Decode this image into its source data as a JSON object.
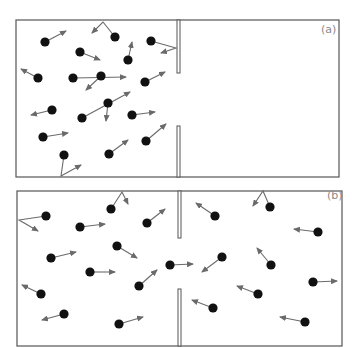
{
  "colors": {
    "frame": "#555555",
    "molecule": "#111111",
    "arrow": "#6a6a6a",
    "divider_fill": "#ffffff",
    "label": "#8a8a8a"
  },
  "panels": [
    {
      "id": "a",
      "label": "(a)",
      "label_pos": [
        321,
        33
      ],
      "box": {
        "x": 16,
        "y": 20,
        "w": 323,
        "h": 157
      },
      "divider": {
        "x": 177,
        "w": 3,
        "upper": [
          20,
          73
        ],
        "lower": [
          126,
          177
        ]
      },
      "molecules": [
        {
          "x": 45,
          "y": 42,
          "path": [
            [
              66,
              31
            ]
          ]
        },
        {
          "x": 115,
          "y": 37,
          "path": [
            [
              103,
              22
            ],
            [
              92,
              33
            ]
          ]
        },
        {
          "x": 80,
          "y": 52,
          "path": [
            [
              100,
              60
            ]
          ]
        },
        {
          "x": 151,
          "y": 41,
          "path": [
            [
              176,
              48
            ],
            [
              161,
              53
            ]
          ]
        },
        {
          "x": 128,
          "y": 60,
          "path": [
            [
              132,
              42
            ]
          ]
        },
        {
          "x": 38,
          "y": 78,
          "path": [
            [
              21,
              69
            ]
          ]
        },
        {
          "x": 73,
          "y": 78,
          "path": [
            [
              126,
              77
            ]
          ]
        },
        {
          "x": 101,
          "y": 76,
          "path": [
            [
              86,
              90
            ]
          ]
        },
        {
          "x": 145,
          "y": 82,
          "path": [
            [
              165,
              72
            ]
          ]
        },
        {
          "x": 52,
          "y": 110,
          "path": [
            [
              31,
              115
            ]
          ]
        },
        {
          "x": 82,
          "y": 118,
          "path": [
            [
              130,
              92
            ]
          ]
        },
        {
          "x": 108,
          "y": 103,
          "path": [
            [
              106,
              121
            ]
          ]
        },
        {
          "x": 132,
          "y": 115,
          "path": [
            [
              155,
              112
            ]
          ]
        },
        {
          "x": 43,
          "y": 137,
          "path": [
            [
              68,
              133
            ]
          ]
        },
        {
          "x": 146,
          "y": 141,
          "path": [
            [
              166,
              124
            ]
          ]
        },
        {
          "x": 109,
          "y": 154,
          "path": [
            [
              128,
              140
            ]
          ]
        },
        {
          "x": 64,
          "y": 155,
          "path": [
            [
              61,
              176
            ],
            [
              81,
              165
            ]
          ]
        }
      ]
    },
    {
      "id": "b",
      "label": "(b)",
      "label_pos": [
        327,
        199
      ],
      "box": {
        "x": 17,
        "y": 191,
        "w": 325,
        "h": 155
      },
      "divider": {
        "x": 178,
        "w": 3,
        "upper": [
          191,
          238
        ],
        "lower": [
          289,
          346
        ]
      },
      "molecules": [
        {
          "x": 46,
          "y": 216,
          "path": [
            [
              19,
              220
            ],
            [
              38,
              231
            ]
          ]
        },
        {
          "x": 111,
          "y": 209,
          "path": [
            [
              122,
              192
            ],
            [
              128,
              204
            ]
          ]
        },
        {
          "x": 80,
          "y": 227,
          "path": [
            [
              105,
              224
            ]
          ]
        },
        {
          "x": 147,
          "y": 223,
          "path": [
            [
              165,
              209
            ]
          ]
        },
        {
          "x": 117,
          "y": 246,
          "path": [
            [
              137,
              258
            ]
          ]
        },
        {
          "x": 51,
          "y": 258,
          "path": [
            [
              76,
              252
            ]
          ]
        },
        {
          "x": 90,
          "y": 272,
          "path": [
            [
              115,
              272
            ]
          ]
        },
        {
          "x": 41,
          "y": 294,
          "path": [
            [
              22,
              285
            ]
          ]
        },
        {
          "x": 64,
          "y": 314,
          "path": [
            [
              42,
              320
            ]
          ]
        },
        {
          "x": 139,
          "y": 286,
          "path": [
            [
              157,
              270
            ]
          ]
        },
        {
          "x": 119,
          "y": 324,
          "path": [
            [
              143,
              317
            ]
          ]
        },
        {
          "x": 170,
          "y": 265,
          "path": [
            [
              193,
              264
            ]
          ]
        },
        {
          "x": 215,
          "y": 216,
          "path": [
            [
              196,
              203
            ]
          ]
        },
        {
          "x": 270,
          "y": 207,
          "path": [
            [
              263,
              191
            ],
            [
              253,
              206
            ]
          ]
        },
        {
          "x": 318,
          "y": 232,
          "path": [
            [
              294,
              229
            ]
          ]
        },
        {
          "x": 222,
          "y": 257,
          "path": [
            [
              202,
              272
            ]
          ]
        },
        {
          "x": 271,
          "y": 265,
          "path": [
            [
              257,
              248
            ]
          ]
        },
        {
          "x": 258,
          "y": 294,
          "path": [
            [
              237,
              286
            ]
          ]
        },
        {
          "x": 313,
          "y": 282,
          "path": [
            [
              337,
              281
            ]
          ]
        },
        {
          "x": 213,
          "y": 308,
          "path": [
            [
              192,
              300
            ]
          ]
        },
        {
          "x": 305,
          "y": 322,
          "path": [
            [
              280,
              317
            ]
          ]
        }
      ]
    }
  ]
}
